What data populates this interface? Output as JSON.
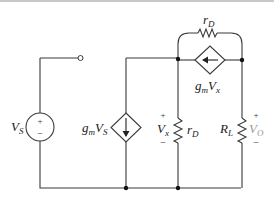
{
  "diagram": {
    "type": "circuit-schematic",
    "components": {
      "vs": {
        "label": "V",
        "sub": "S",
        "plus": "+",
        "minus": "−"
      },
      "gm_vs": {
        "label_g": "g",
        "label_m": "m",
        "label_V": "V",
        "label_sub": "S"
      },
      "rd_top": {
        "label": "r",
        "sub": "D"
      },
      "gm_vx": {
        "label_g": "g",
        "label_m": "m",
        "label_V": "V",
        "label_sub": "x"
      },
      "vx": {
        "label": "V",
        "sub": "x",
        "plus": "+",
        "minus": "−"
      },
      "rd_mid": {
        "label": "r",
        "sub": "D"
      },
      "rl": {
        "label": "R",
        "sub": "L"
      },
      "vo": {
        "label": "V",
        "sub": "O",
        "plus": "+",
        "minus": "−"
      }
    }
  }
}
